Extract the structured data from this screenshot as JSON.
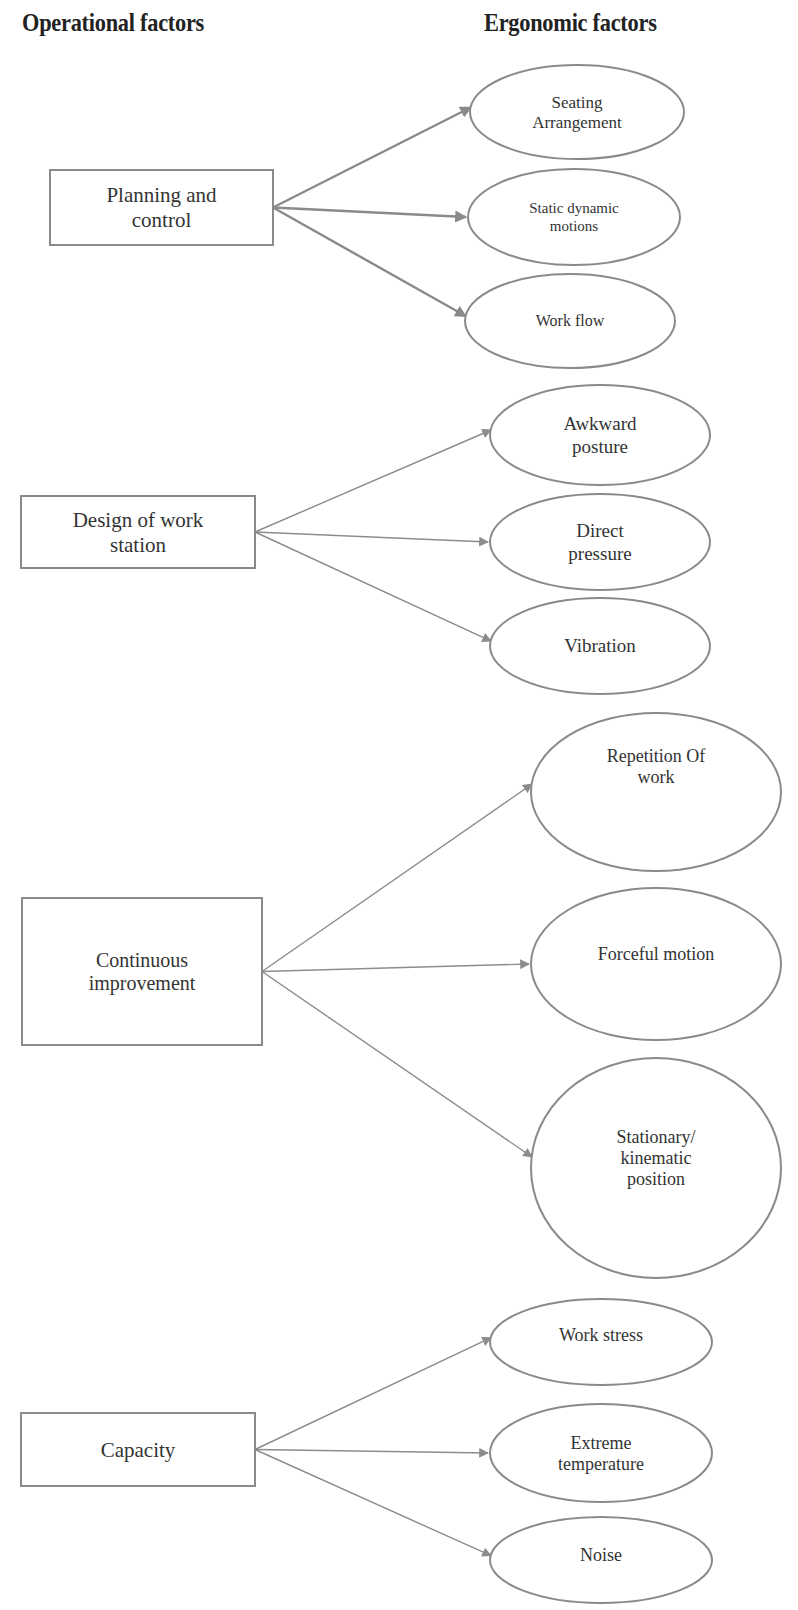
{
  "headers": {
    "left": "Operational factors",
    "right": "Ergonomic factors"
  },
  "colors": {
    "stroke": "#8a8a8a",
    "text": "#333333",
    "background": "#ffffff"
  },
  "groups": [
    {
      "id": "planning",
      "operational": {
        "label_lines": [
          "Planning  and",
          "control"
        ],
        "box": [
          50,
          170,
          223,
          75
        ],
        "font": 21
      },
      "thick_edges": true,
      "ergonomic": [
        {
          "label_lines": [
            "Seating",
            "Arrangement"
          ],
          "ellipse": [
            577,
            112,
            107,
            47
          ],
          "font": 17
        },
        {
          "label_lines": [
            "Static dynamic",
            "motions"
          ],
          "ellipse": [
            574,
            217,
            106,
            48
          ],
          "font": 15
        },
        {
          "label_lines": [
            "Work flow"
          ],
          "ellipse": [
            570,
            321,
            105,
            47
          ],
          "font": 16
        }
      ]
    },
    {
      "id": "design",
      "operational": {
        "label_lines": [
          "Design of work",
          "station"
        ],
        "box": [
          21,
          496,
          234,
          72
        ],
        "font": 21
      },
      "thick_edges": false,
      "ergonomic": [
        {
          "label_lines": [
            "Awkward",
            "posture"
          ],
          "ellipse": [
            600,
            435,
            110,
            50
          ],
          "font": 19
        },
        {
          "label_lines": [
            "Direct",
            "pressure"
          ],
          "ellipse": [
            600,
            542,
            110,
            48
          ],
          "font": 19
        },
        {
          "label_lines": [
            "Vibration"
          ],
          "ellipse": [
            600,
            646,
            110,
            48
          ],
          "font": 19
        }
      ]
    },
    {
      "id": "continuous",
      "operational": {
        "label_lines": [
          "Continuous",
          "improvement"
        ],
        "box": [
          22,
          898,
          240,
          147
        ],
        "font": 20
      },
      "thick_edges": false,
      "ergonomic": [
        {
          "label_lines": [
            "Repetition Of",
            "work"
          ],
          "ellipse": [
            656,
            792,
            125,
            79
          ],
          "font": 18,
          "text_dy": -26
        },
        {
          "label_lines": [
            "Forceful motion"
          ],
          "ellipse": [
            656,
            964,
            125,
            76
          ],
          "font": 18,
          "text_dy": -10
        },
        {
          "label_lines": [
            "Stationary/",
            "kinematic",
            "position"
          ],
          "ellipse": [
            656,
            1168,
            125,
            110
          ],
          "font": 18,
          "text_dy": -10
        }
      ]
    },
    {
      "id": "capacity",
      "operational": {
        "label_lines": [
          "Capacity"
        ],
        "box": [
          21,
          1413,
          234,
          73
        ],
        "font": 21
      },
      "thick_edges": false,
      "ergonomic": [
        {
          "label_lines": [
            "Work stress"
          ],
          "ellipse": [
            601,
            1342,
            111,
            43
          ],
          "font": 18,
          "text_dy": -7
        },
        {
          "label_lines": [
            "Extreme",
            "temperature"
          ],
          "ellipse": [
            601,
            1453,
            111,
            49
          ],
          "font": 18
        },
        {
          "label_lines": [
            "Noise"
          ],
          "ellipse": [
            601,
            1560,
            111,
            43
          ],
          "font": 18,
          "text_dy": -5
        }
      ]
    }
  ]
}
